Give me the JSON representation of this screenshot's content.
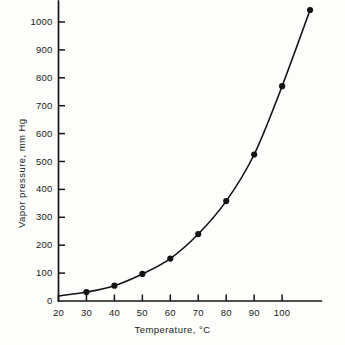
{
  "chart_data": {
    "type": "line",
    "title": "",
    "xlabel": "Temperature, °C",
    "ylabel": "Vapor pressure, mm Hg",
    "xlim": [
      20,
      114
    ],
    "ylim": [
      0,
      1075
    ],
    "grid": false,
    "legend": "none",
    "xticks": [
      20,
      30,
      40,
      50,
      60,
      70,
      80,
      90,
      100
    ],
    "xtick_labels": [
      "20",
      "30",
      "40",
      "50",
      "60",
      "70",
      "80",
      "90",
      "100"
    ],
    "yticks": [
      0,
      100,
      200,
      300,
      400,
      500,
      600,
      700,
      800,
      900,
      1000
    ],
    "ytick_labels": [
      "0",
      "100",
      "200",
      "300",
      "400",
      "500",
      "600",
      "700",
      "800",
      "900",
      "1000"
    ],
    "marker": "filled-circle",
    "marker_color": "#141414",
    "line_color": "#141414",
    "x": [
      30,
      40,
      50,
      60,
      70,
      80,
      90,
      100,
      110
    ],
    "values": [
      32,
      55,
      97,
      152,
      240,
      358,
      525,
      770,
      1043
    ],
    "series": [
      {
        "name": "Vapor pressure",
        "x": [
          30,
          40,
          50,
          60,
          70,
          80,
          90,
          100,
          110
        ],
        "values": [
          32,
          55,
          97,
          152,
          240,
          358,
          525,
          770,
          1043
        ]
      }
    ],
    "curve_start": [
      20,
      18
    ],
    "annotations": []
  },
  "figure": {
    "background_color": "#fdfdfc",
    "ink_color": "#141414"
  }
}
